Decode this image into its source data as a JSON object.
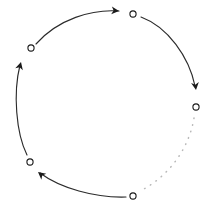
{
  "figure": {
    "title": "",
    "background_color": "#ffffff",
    "width": 212,
    "height": 212
  },
  "chart_data": {
    "type": "diagram",
    "subtype": "cyclic-node-graph",
    "title": "",
    "xlabel": "",
    "ylabel": "",
    "grid": false,
    "legend": false,
    "layout": {
      "shape": "circle",
      "center_x": 113,
      "center_y": 105,
      "radius": 84,
      "direction": "clockwise"
    },
    "node_style": {
      "marker": "open-circle",
      "radius": 3.1,
      "fill_color": "#ffffff",
      "stroke_color": "#1a1a1a",
      "stroke_width": 1.1
    },
    "nodes": [
      {
        "id": "n1",
        "label": "",
        "x": 133,
        "y": 14,
        "angle_deg": 282
      },
      {
        "id": "n2",
        "label": "",
        "x": 196,
        "y": 107,
        "angle_deg": 358
      },
      {
        "id": "n3",
        "label": "",
        "x": 133,
        "y": 196,
        "angle_deg": 76
      },
      {
        "id": "n4",
        "label": "",
        "x": 30,
        "y": 162,
        "angle_deg": 147
      },
      {
        "id": "n5",
        "label": "",
        "x": 31,
        "y": 48,
        "angle_deg": 216
      }
    ],
    "edges": [
      {
        "id": "e1",
        "from": "n5",
        "to": "n1",
        "style": "solid",
        "arrow": true,
        "color": "#2b2b2b",
        "path": "M 36 44 C 58 19, 92 9, 119 11"
      },
      {
        "id": "e2",
        "from": "n1",
        "to": "n2",
        "style": "solid",
        "arrow": true,
        "color": "#2b2b2b",
        "path": "M 141 17 C 168 27, 189 57, 195 86"
      },
      {
        "id": "e3",
        "from": "n2",
        "to": "n3",
        "style": "dotted",
        "arrow": false,
        "color": "#b9b9b9",
        "path": "M 194 118 C 189 148, 170 175, 142 190"
      },
      {
        "id": "e4",
        "from": "n3",
        "to": "n4",
        "style": "solid",
        "arrow": true,
        "color": "#2b2b2b",
        "path": "M 126 197 C 95 198, 60 188, 40 173"
      },
      {
        "id": "e5",
        "from": "n4",
        "to": "n5",
        "style": "solid",
        "arrow": true,
        "color": "#2b2b2b",
        "path": "M 27 155 C 16 133, 13 93, 20 65"
      }
    ],
    "arrowheads": [
      {
        "edge": "e1",
        "x": 119,
        "y": 11,
        "angle_deg": 5,
        "size": 7.5
      },
      {
        "edge": "e2",
        "x": 196,
        "y": 90,
        "angle_deg": 82,
        "size": 7.5
      },
      {
        "edge": "e4",
        "x": 38,
        "y": 172,
        "angle_deg": 219,
        "size": 7.5
      },
      {
        "edge": "e5",
        "x": 21,
        "y": 62,
        "angle_deg": 285,
        "size": 7.5
      }
    ]
  }
}
